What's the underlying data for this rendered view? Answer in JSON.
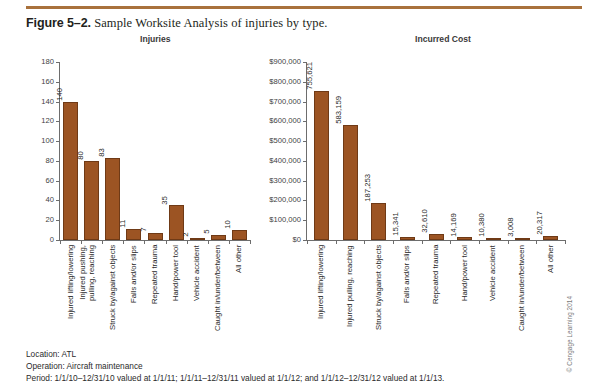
{
  "figure": {
    "number": "Figure 5–2.",
    "caption": "Sample Worksite Analysis of injuries by type."
  },
  "copyright": "© Cengage Learning 2014",
  "footer": {
    "location": "Location: ATL",
    "operation": "Operation: Aircraft maintenance",
    "period": "Period: 1/1/10–12/31/10 valued at 1/1/11; 1/1/11–12/31/11 valued at 1/1/12; and 1/1/12–12/31/12 valued at 1/1/13."
  },
  "chart_data": [
    {
      "id": "injuries",
      "type": "bar",
      "title": "Injuries",
      "xlabel": "",
      "ylabel": "",
      "ylim": [
        0,
        180
      ],
      "yticks": [
        0,
        20,
        40,
        60,
        80,
        100,
        120,
        140,
        160,
        180
      ],
      "ytick_labels": [
        "0",
        "20",
        "40",
        "60",
        "80",
        "100",
        "120",
        "140",
        "160",
        "180"
      ],
      "grid": false,
      "legend": "none",
      "bar_color": "#9c5423",
      "categories": [
        "Injured lifting/lowering",
        "Injured pushing, pulling, reaching",
        "Struck by/against objects",
        "Falls and/or slips",
        "Repeated trauma",
        "Hand/power tool",
        "Vehicle accident",
        "Caught in/under/between",
        "All other"
      ],
      "category_lines": [
        [
          "Injured lifting/lowering"
        ],
        [
          "Injured pushing,",
          "pulling, reaching"
        ],
        [
          "Struck by/against objects"
        ],
        [
          "Falls and/or slips"
        ],
        [
          "Repeated trauma"
        ],
        [
          "Hand/power tool"
        ],
        [
          "Vehicle accident"
        ],
        [
          "Caught in/under/between"
        ],
        [
          "All other"
        ]
      ],
      "values": [
        140,
        80,
        83,
        11,
        7,
        35,
        2,
        5,
        10
      ],
      "value_labels": [
        "140",
        "80",
        "83",
        "11",
        "7",
        "35",
        "2",
        "5",
        "10"
      ]
    },
    {
      "id": "incurred-cost",
      "type": "bar",
      "title": "Incurred Cost",
      "xlabel": "",
      "ylabel": "",
      "ylim": [
        0,
        900000
      ],
      "yticks": [
        0,
        100000,
        200000,
        300000,
        400000,
        500000,
        600000,
        700000,
        800000,
        900000
      ],
      "ytick_labels": [
        "$0",
        "$100,000",
        "$200,000",
        "$300,000",
        "$400,000",
        "$500,000",
        "$600,000",
        "$700,000",
        "$800,000",
        "$900,000"
      ],
      "grid": false,
      "legend": "none",
      "bar_color": "#9c5423",
      "categories": [
        "Injured lifting/lowering",
        "Injured pulling, reaching",
        "Struck by/against objects",
        "Falls and/or slips",
        "Repeated trauma",
        "Hand/power tool",
        "Vehicle accident",
        "Caught in/under/between",
        "All other"
      ],
      "category_lines": [
        [
          "Injured lifting/lowering"
        ],
        [
          "Injured pulling, reaching"
        ],
        [
          "Struck by/against objects"
        ],
        [
          "Falls and/or slips"
        ],
        [
          "Repeated trauma"
        ],
        [
          "Hand/power tool"
        ],
        [
          "Vehicle accident"
        ],
        [
          "Caught in/under/between"
        ],
        [
          "All other"
        ]
      ],
      "values": [
        755621,
        583159,
        187253,
        15341,
        32610,
        14169,
        10380,
        3008,
        20317
      ],
      "value_labels": [
        "755,621",
        "583,159",
        "187,253",
        "15,341",
        "32,610",
        "14,169",
        "10,380",
        "3,008",
        "20,317"
      ]
    }
  ]
}
